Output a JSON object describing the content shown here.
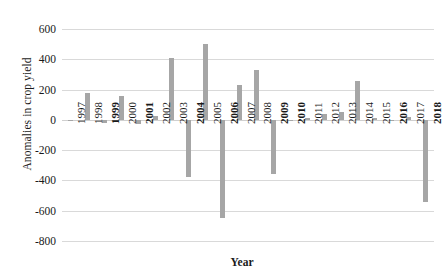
{
  "chart_data": {
    "type": "bar",
    "title": "",
    "xlabel": "Year",
    "ylabel": "Anomalies in crop yield",
    "ylim": [
      -800,
      700
    ],
    "yticks": [
      600,
      400,
      200,
      0,
      -200,
      -400,
      -600,
      -800
    ],
    "ytick_labels": [
      "600",
      "400",
      "200",
      "0",
      "-200",
      "-400",
      "-600",
      "-800"
    ],
    "grid": true,
    "legend": "none",
    "bar_color": "#a6a6a6",
    "categories": [
      "1997",
      "1998",
      "1999",
      "2000",
      "2001",
      "2002",
      "2003",
      "2004",
      "2005",
      "2006",
      "2007",
      "2008",
      "2009",
      "2010",
      "2011",
      "2012",
      "2013",
      "2014",
      "2015",
      "2016",
      "2017",
      "2018"
    ],
    "values": [
      0,
      175,
      -20,
      160,
      -25,
      25,
      410,
      -380,
      500,
      -650,
      230,
      330,
      -355,
      -10,
      15,
      40,
      55,
      260,
      15,
      -10,
      20,
      -545
    ]
  },
  "axes": {
    "y_title": "Anomalies in crop yield",
    "x_title": "Year"
  }
}
